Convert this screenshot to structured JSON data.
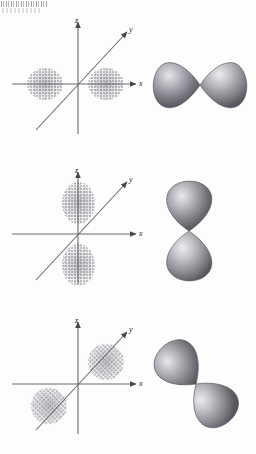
{
  "figure": {
    "background_color": "#fdfdfd",
    "axis_color": "#5d5d66",
    "label_color": "#1c1c1c",
    "lobe_dark": "#5f6066",
    "lobe_mid": "#8a8b91",
    "lobe_light": "#d8d9dd",
    "cloud_color": "#70707a",
    "scan_artifact_text": ""
  },
  "axis_labels": {
    "z": "z",
    "y": "y",
    "x": "x"
  },
  "panels": [
    {
      "id": "panel-px",
      "orbital": "px",
      "orbital_label": "",
      "cloud_orientation": "along x-axis (horizontal)",
      "lobe_orientation": "horizontal",
      "lobe_count": 2
    },
    {
      "id": "panel-pz",
      "orbital": "pz",
      "orbital_label": "",
      "cloud_orientation": "along z-axis (vertical)",
      "lobe_orientation": "vertical",
      "lobe_count": 2
    },
    {
      "id": "panel-py",
      "orbital": "py",
      "orbital_label": "",
      "cloud_orientation": "along y-axis (diagonal)",
      "lobe_orientation": "diagonal",
      "lobe_count": 2
    }
  ]
}
